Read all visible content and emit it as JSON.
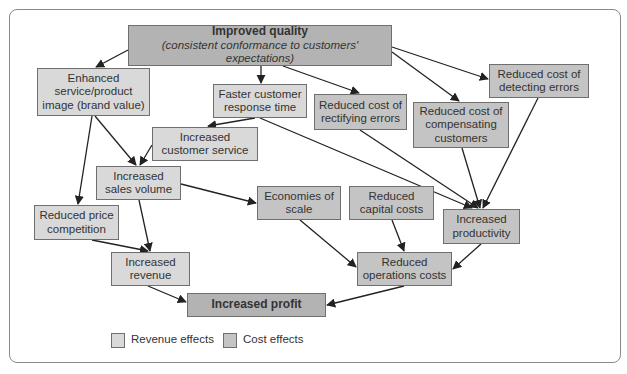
{
  "diagram": {
    "nodes": {
      "improved_quality": {
        "title": "Improved quality",
        "subtitle": "(consistent conformance to customers' expectations)",
        "type": "root"
      },
      "enhanced_image": {
        "lines": [
          "Enhanced",
          "service/product",
          "image (brand value)"
        ],
        "type": "revenue"
      },
      "faster_response": {
        "lines": [
          "Faster customer",
          "response time"
        ],
        "type": "revenue"
      },
      "reduced_rectifying": {
        "lines": [
          "Reduced cost of",
          "rectifying errors"
        ],
        "type": "cost"
      },
      "reduced_compensating": {
        "lines": [
          "Reduced cost of",
          "compensating",
          "customers"
        ],
        "type": "cost"
      },
      "reduced_detecting": {
        "lines": [
          "Reduced cost of",
          "detecting errors"
        ],
        "type": "cost"
      },
      "increased_service": {
        "lines": [
          "Increased",
          "customer service"
        ],
        "type": "revenue"
      },
      "increased_sales": {
        "lines": [
          "Increased",
          "sales volume"
        ],
        "type": "revenue"
      },
      "economies_scale": {
        "lines": [
          "Economies of",
          "scale"
        ],
        "type": "cost"
      },
      "reduced_capital": {
        "lines": [
          "Reduced",
          "capital costs"
        ],
        "type": "cost"
      },
      "increased_productivity": {
        "lines": [
          "Increased",
          "productivity"
        ],
        "type": "cost"
      },
      "reduced_price_comp": {
        "lines": [
          "Reduced price",
          "competition"
        ],
        "type": "revenue"
      },
      "increased_revenue": {
        "lines": [
          "Increased",
          "revenue"
        ],
        "type": "revenue"
      },
      "reduced_operations": {
        "lines": [
          "Reduced",
          "operations costs"
        ],
        "type": "cost"
      },
      "increased_profit": {
        "title": "Increased profit",
        "type": "root"
      }
    },
    "edges": [
      [
        "improved_quality",
        "enhanced_image"
      ],
      [
        "improved_quality",
        "faster_response"
      ],
      [
        "improved_quality",
        "reduced_rectifying"
      ],
      [
        "improved_quality",
        "reduced_compensating"
      ],
      [
        "improved_quality",
        "reduced_detecting"
      ],
      [
        "enhanced_image",
        "increased_sales"
      ],
      [
        "enhanced_image",
        "reduced_price_comp"
      ],
      [
        "faster_response",
        "increased_service"
      ],
      [
        "faster_response",
        "increased_productivity"
      ],
      [
        "increased_service",
        "increased_sales"
      ],
      [
        "reduced_rectifying",
        "increased_productivity"
      ],
      [
        "reduced_compensating",
        "increased_productivity"
      ],
      [
        "reduced_detecting",
        "increased_productivity"
      ],
      [
        "increased_sales",
        "economies_scale"
      ],
      [
        "increased_sales",
        "increased_revenue"
      ],
      [
        "reduced_price_comp",
        "increased_revenue"
      ],
      [
        "economies_scale",
        "reduced_operations"
      ],
      [
        "reduced_capital",
        "reduced_operations"
      ],
      [
        "increased_productivity",
        "reduced_operations"
      ],
      [
        "increased_revenue",
        "increased_profit"
      ],
      [
        "reduced_operations",
        "increased_profit"
      ]
    ]
  },
  "legend": {
    "revenue_label": "Revenue effects",
    "cost_label": "Cost effects",
    "revenue_color": "#d9d9d9",
    "cost_color": "#c4c4c4"
  },
  "colors": {
    "revenue_fill": "#d9d9d9",
    "cost_fill": "#c4c4c4",
    "root_fill": "#b3b3b3",
    "border": "#6f6f6f",
    "arrow": "#222222"
  }
}
